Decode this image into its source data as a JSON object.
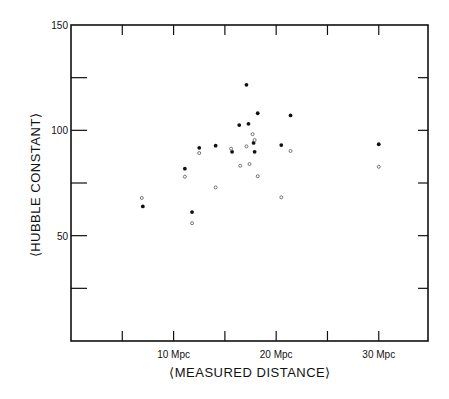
{
  "chart_data": {
    "type": "scatter",
    "title": "",
    "xlabel": "⟨MEASURED DISTANCE⟩",
    "ylabel": "⟨HUBBLE CONSTANT⟩",
    "xlim": [
      0,
      34.8
    ],
    "ylim": [
      0,
      150
    ],
    "grid": false,
    "legend": null,
    "x_ticks": [
      5,
      10,
      15,
      20,
      25,
      30
    ],
    "x_tick_labels": {
      "10": "10 Mpc",
      "20": "20 Mpc",
      "30": "30 Mpc"
    },
    "y_ticks": [
      25,
      50,
      75,
      100,
      125,
      150
    ],
    "y_tick_labels": {
      "50": "50",
      "100": "100",
      "150": "150"
    },
    "series": [
      {
        "name": "filled",
        "marker": "filled-circle",
        "points": [
          [
            7.0,
            63.9
          ],
          [
            11.1,
            81.8
          ],
          [
            11.8,
            61.2
          ],
          [
            12.5,
            91.7
          ],
          [
            14.1,
            92.7
          ],
          [
            15.7,
            89.8
          ],
          [
            16.4,
            102.5
          ],
          [
            17.1,
            121.6
          ],
          [
            17.3,
            103.1
          ],
          [
            17.8,
            94.0
          ],
          [
            17.9,
            89.8
          ],
          [
            18.2,
            108.1
          ],
          [
            20.5,
            93.0
          ],
          [
            21.4,
            107.1
          ],
          [
            30.0,
            93.4
          ]
        ]
      },
      {
        "name": "open",
        "marker": "open-circle",
        "points": [
          [
            6.9,
            67.9
          ],
          [
            11.1,
            78.0
          ],
          [
            11.8,
            55.9
          ],
          [
            12.5,
            89.2
          ],
          [
            14.1,
            72.9
          ],
          [
            15.6,
            91.3
          ],
          [
            16.5,
            83.2
          ],
          [
            17.1,
            92.4
          ],
          [
            17.4,
            84.0
          ],
          [
            17.7,
            98.2
          ],
          [
            17.9,
            95.4
          ],
          [
            18.2,
            78.2
          ],
          [
            20.5,
            68.2
          ],
          [
            21.4,
            90.2
          ],
          [
            30.0,
            82.7
          ]
        ]
      }
    ]
  }
}
